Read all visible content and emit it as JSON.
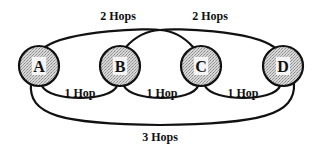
{
  "diagram": {
    "title": "",
    "colors": {
      "stroke": "#111111",
      "node_fill": "#c8c8c8",
      "background": "#ffffff"
    },
    "nodes": [
      {
        "id": "A",
        "label": "A"
      },
      {
        "id": "B",
        "label": "B"
      },
      {
        "id": "C",
        "label": "C"
      },
      {
        "id": "D",
        "label": "D"
      }
    ],
    "edges": [
      {
        "from": "A",
        "to": "B",
        "label": "1 Hop"
      },
      {
        "from": "B",
        "to": "C",
        "label": "1 Hop"
      },
      {
        "from": "C",
        "to": "D",
        "label": "1 Hop"
      },
      {
        "from": "A",
        "to": "C",
        "label": "2 Hops"
      },
      {
        "from": "B",
        "to": "D",
        "label": "2 Hops"
      },
      {
        "from": "A",
        "to": "D",
        "label": "3 Hops"
      }
    ]
  }
}
